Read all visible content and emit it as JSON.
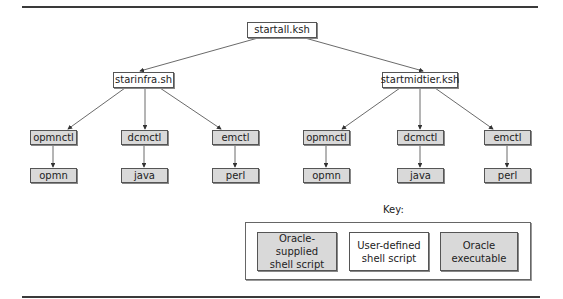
{
  "diagram": {
    "root": {
      "label": "startall.ksh",
      "type": "user-defined"
    },
    "level1": [
      {
        "label": "starinfra.sh",
        "type": "user-defined"
      },
      {
        "label": "startmidtier.ksh",
        "type": "user-defined"
      }
    ],
    "level2_left": [
      {
        "label": "opmnctl",
        "type": "oracle-supplied"
      },
      {
        "label": "dcmctl",
        "type": "oracle-supplied"
      },
      {
        "label": "emctl",
        "type": "oracle-supplied"
      }
    ],
    "level3_left": [
      {
        "label": "opmn",
        "type": "oracle-executable"
      },
      {
        "label": "java",
        "type": "oracle-executable"
      },
      {
        "label": "perl",
        "type": "oracle-executable"
      }
    ],
    "level2_right": [
      {
        "label": "opmnctl",
        "type": "oracle-supplied"
      },
      {
        "label": "dcmctl",
        "type": "oracle-supplied"
      },
      {
        "label": "emctl",
        "type": "oracle-supplied"
      }
    ],
    "level3_right": [
      {
        "label": "opmn",
        "type": "oracle-executable"
      },
      {
        "label": "java",
        "type": "oracle-executable"
      },
      {
        "label": "perl",
        "type": "oracle-executable"
      }
    ],
    "edges": [
      [
        "startall.ksh",
        "starinfra.sh"
      ],
      [
        "startall.ksh",
        "startmidtier.ksh"
      ],
      [
        "starinfra.sh",
        "opmnctl"
      ],
      [
        "starinfra.sh",
        "dcmctl"
      ],
      [
        "starinfra.sh",
        "emctl"
      ],
      [
        "startmidtier.ksh",
        "opmnctl"
      ],
      [
        "startmidtier.ksh",
        "dcmctl"
      ],
      [
        "startmidtier.ksh",
        "emctl"
      ],
      [
        "opmnctl",
        "opmn"
      ],
      [
        "dcmctl",
        "java"
      ],
      [
        "emctl",
        "perl"
      ]
    ]
  },
  "key": {
    "title": "Key:",
    "items": [
      {
        "line1": "Oracle-supplied",
        "line2": "shell script",
        "fill": "#d9d9d9"
      },
      {
        "line1": "User-defined",
        "line2": "shell script",
        "fill": "#ffffff"
      },
      {
        "line1": "Oracle",
        "line2": "executable",
        "fill": "#d9d9d9"
      }
    ]
  },
  "colors": {
    "gray_fill": "#d9d9d9",
    "white_fill": "#ffffff",
    "stroke": "#555555"
  }
}
